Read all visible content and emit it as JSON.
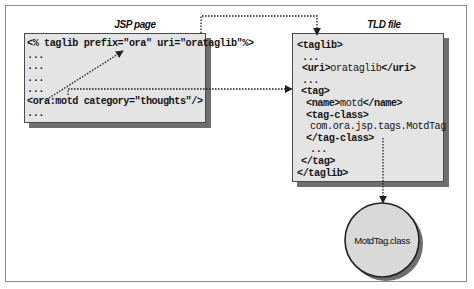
{
  "diagram": {
    "jsp_box": {
      "label": "JSP page",
      "lines": [
        {
          "indent": 0,
          "parts": [
            {
              "t": "<% taglib prefix=\"ora\" uri=\"orataglib\"%>",
              "bold": true
            }
          ]
        },
        {
          "indent": 0,
          "parts": [
            {
              "t": "...",
              "bold": true
            }
          ]
        },
        {
          "indent": 0,
          "parts": [
            {
              "t": "...",
              "bold": true
            }
          ]
        },
        {
          "indent": 0,
          "parts": [
            {
              "t": "...",
              "bold": true
            }
          ]
        },
        {
          "indent": 0,
          "parts": [
            {
              "t": "...",
              "bold": true
            }
          ]
        },
        {
          "indent": 0,
          "parts": [
            {
              "t": "<ora:motd category=\"thoughts\"/>",
              "bold": true
            }
          ]
        },
        {
          "indent": 0,
          "parts": [
            {
              "t": "...",
              "bold": true
            }
          ]
        }
      ]
    },
    "tld_box": {
      "label": "TLD file",
      "lines": [
        {
          "indent": 0,
          "parts": [
            {
              "t": "<taglib>",
              "bold": true
            }
          ]
        },
        {
          "indent": 5,
          "parts": [
            {
              "t": "...",
              "bold": true
            }
          ]
        },
        {
          "indent": 5,
          "parts": [
            {
              "t": "<uri>",
              "bold": true
            },
            {
              "t": "orataglib",
              "bold": false
            },
            {
              "t": "</uri>",
              "bold": true
            }
          ]
        },
        {
          "indent": 5,
          "parts": [
            {
              "t": "...",
              "bold": true
            }
          ]
        },
        {
          "indent": 4,
          "parts": [
            {
              "t": "<tag>",
              "bold": true
            }
          ]
        },
        {
          "indent": 9,
          "parts": [
            {
              "t": "<name>",
              "bold": true
            },
            {
              "t": "motd",
              "bold": false
            },
            {
              "t": "</name>",
              "bold": true
            }
          ]
        },
        {
          "indent": 9,
          "parts": [
            {
              "t": "<tag-class>",
              "bold": true
            }
          ]
        },
        {
          "indent": 13,
          "parts": [
            {
              "t": "com.ora.jsp.tags.MotdTag",
              "bold": false
            }
          ]
        },
        {
          "indent": 9,
          "parts": [
            {
              "t": "</tag-class>",
              "bold": true
            }
          ]
        },
        {
          "indent": 13,
          "parts": [
            {
              "t": "...",
              "bold": true
            }
          ]
        },
        {
          "indent": 4,
          "parts": [
            {
              "t": "</tag>",
              "bold": true
            }
          ]
        },
        {
          "indent": 0,
          "parts": [
            {
              "t": "</taglib>",
              "bold": true
            }
          ]
        }
      ]
    },
    "class_node": {
      "label": "MotdTag.class"
    },
    "connectors": [
      {
        "from": "jsp taglib uri",
        "to": "tld <taglib>",
        "style": "dotted",
        "description": "uri maps to TLD file"
      },
      {
        "from": "jsp <ora:motd>",
        "to": "jsp prefix=\"ora\"",
        "style": "dotted",
        "description": "prefix reference"
      },
      {
        "from": "jsp <ora:motd>",
        "to": "tld <tag>",
        "style": "dotted",
        "description": "tag name lookup"
      },
      {
        "from": "tld tag-class",
        "to": "MotdTag.class",
        "style": "dotted",
        "description": "class implementation"
      }
    ],
    "colors": {
      "box_fill": "#e4e4e4",
      "box_border": "#4a4a4a",
      "shadow": "#6e6e6e",
      "circle_fill": "#d9d9d9",
      "line": "#222222"
    }
  }
}
